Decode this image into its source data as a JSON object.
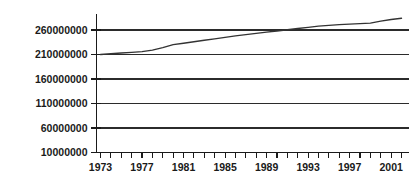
{
  "chart_data": {
    "type": "line",
    "title": "",
    "subtitle": "",
    "xlabel": "",
    "ylabel": "",
    "grid": true,
    "legend": false,
    "legend_position": "none",
    "xlim": [
      1972,
      2003
    ],
    "ylim": [
      10000000,
      285000000
    ],
    "y_ticks": [
      10000000,
      60000000,
      110000000,
      160000000,
      210000000,
      260000000
    ],
    "y_tick_labels": [
      "10000000",
      "60000000",
      "110000000",
      "160000000",
      "210000000",
      "260000000"
    ],
    "x_ticks_major": [
      1973,
      1977,
      1981,
      1985,
      1989,
      1993,
      1997,
      2001
    ],
    "x_tick_labels": [
      "1973",
      "1977",
      "1981",
      "1985",
      "1989",
      "1993",
      "1997",
      "2001"
    ],
    "x_minor_tick_interval": 1,
    "x": [
      1973,
      1974,
      1975,
      1976,
      1977,
      1978,
      1979,
      1980,
      1981,
      1982,
      1983,
      1984,
      1985,
      1986,
      1987,
      1988,
      1989,
      1990,
      1991,
      1992,
      1993,
      1994,
      1995,
      1996,
      1997,
      1998,
      1999,
      2000,
      2001,
      2002
    ],
    "series": [
      {
        "name": "series-1",
        "color": "#333333",
        "values": [
          210000000,
          211500000,
          213000000,
          214500000,
          216000000,
          219000000,
          224000000,
          230000000,
          233000000,
          236000000,
          239000000,
          242000000,
          245000000,
          248000000,
          250500000,
          253000000,
          255500000,
          258000000,
          260500000,
          263000000,
          265500000,
          268000000,
          269500000,
          271000000,
          272000000,
          273000000,
          274000000,
          278000000,
          281500000,
          284000000
        ]
      }
    ]
  },
  "axes": {
    "y_axis_name": "y-axis",
    "x_axis_name": "x-axis"
  }
}
